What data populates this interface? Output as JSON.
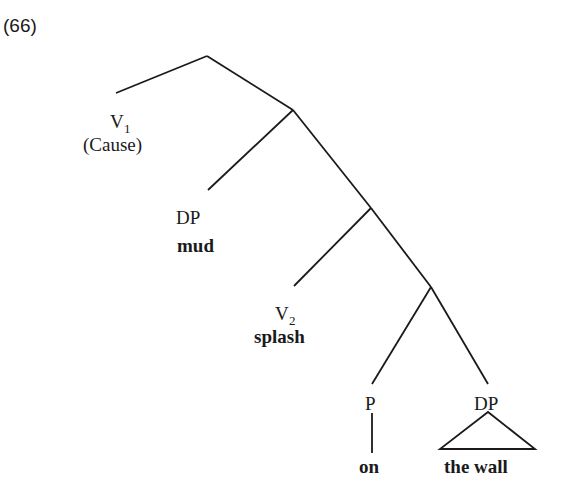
{
  "example_number": "(66)",
  "nodes": {
    "v1": {
      "category": "V",
      "subscript": "1",
      "gloss": "(Cause)"
    },
    "dp_mud": {
      "category": "DP",
      "word": "mud"
    },
    "v2": {
      "category": "V",
      "subscript": "2",
      "word": "splash"
    },
    "p": {
      "category": "P",
      "word": "on"
    },
    "dp_wall": {
      "category": "DP",
      "word": "the wall"
    }
  },
  "colors": {
    "ink": "#1a1a1a",
    "background": "#ffffff"
  }
}
